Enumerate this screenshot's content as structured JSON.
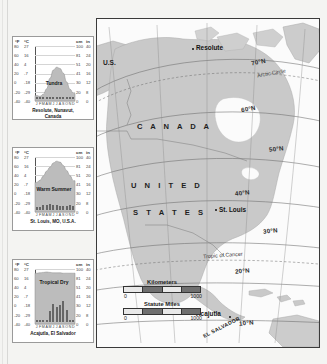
{
  "map": {
    "title": "North America climate regions map",
    "countries": [
      {
        "name": "CANADA",
        "label": "C A N A D A"
      },
      {
        "name": "UNITED",
        "label": "U N I T E D"
      },
      {
        "name": "STATES",
        "label": "S T A T E S"
      }
    ],
    "us_alaska_label": "U.S.",
    "el_salvador_label": "EL SALVADOR",
    "cities": [
      {
        "name": "Resolute",
        "label": "Resolute"
      },
      {
        "name": "St. Louis",
        "label": "St. Louis"
      },
      {
        "name": "Acajutla",
        "label": "Acajutla"
      }
    ],
    "latitudes": [
      {
        "label": "70°N"
      },
      {
        "label": "60°N"
      },
      {
        "label": "50°N"
      },
      {
        "label": "40°N"
      },
      {
        "label": "30°N"
      },
      {
        "label": "20°N"
      },
      {
        "label": "10°N"
      }
    ],
    "special_lines": [
      {
        "label": "Arctic Circle"
      },
      {
        "label": "Tropic of Cancer"
      }
    ],
    "scale": {
      "kilometers_title": "Kilometers",
      "kilometers_min": "0",
      "kilometers_max": "1000",
      "miles_title": "Statute Miles",
      "miles_min": "0",
      "miles_max": "1000"
    },
    "colors": {
      "land": "#c9c9c9",
      "ocean": "#fbfbfb",
      "frame": "#3a3a3a",
      "graticule": "#6b6b6b"
    }
  },
  "chart_data": [
    {
      "type": "bar",
      "id": "resolute",
      "title": "Tundra",
      "caption_line1": "Resolute, Nunavut,",
      "caption_line2": "Canada",
      "xlabel": "",
      "ylabel_left_f": "°F",
      "ylabel_left_c": "°C",
      "ylabel_right_cm": "cm",
      "ylabel_right_in": "in",
      "categories": [
        "J",
        "F",
        "M",
        "A",
        "M",
        "J",
        "J",
        "A",
        "S",
        "O",
        "N",
        "D"
      ],
      "yticks_f": [
        "80",
        "60",
        "40",
        "20",
        "0",
        "-20",
        "-40"
      ],
      "yticks_c": [
        "27",
        "16",
        "4",
        "-7",
        "-18",
        "-29",
        "-40"
      ],
      "yticks_cm": [
        "100",
        "81",
        "51",
        "41",
        "30",
        "20",
        "0"
      ],
      "yticks_in": [
        "40",
        "24",
        "20",
        "16",
        "12",
        "8",
        "0"
      ],
      "temp_f": [
        -27,
        -29,
        -24,
        -11,
        14,
        33,
        40,
        37,
        26,
        5,
        -12,
        -22
      ],
      "precip_cm": [
        0.4,
        0.3,
        0.5,
        0.8,
        0.9,
        1.3,
        2.3,
        3.6,
        2.5,
        1.3,
        0.6,
        0.4
      ],
      "ylim_f": [
        -40,
        90
      ],
      "ylim_cm": [
        0,
        100
      ],
      "grid": true
    },
    {
      "type": "bar",
      "id": "st-louis",
      "title": "Warm Summer",
      "caption_line1": "St. Louis,  MO, U.S.A.",
      "caption_line2": "",
      "xlabel": "",
      "ylabel_left_f": "°F",
      "ylabel_left_c": "°C",
      "ylabel_right_cm": "cm",
      "ylabel_right_in": "in",
      "categories": [
        "J",
        "F",
        "M",
        "A",
        "M",
        "J",
        "J",
        "A",
        "S",
        "O",
        "N",
        "D"
      ],
      "yticks_f": [
        "80",
        "60",
        "40",
        "20",
        "0",
        "-20",
        "-40"
      ],
      "yticks_c": [
        "27",
        "16",
        "4",
        "-7",
        "-18",
        "-29",
        "-40"
      ],
      "yticks_cm": [
        "100",
        "81",
        "51",
        "41",
        "30",
        "20",
        "0"
      ],
      "yticks_in": [
        "40",
        "24",
        "20",
        "16",
        "12",
        "8",
        "0"
      ],
      "temp_f": [
        30,
        35,
        45,
        57,
        66,
        76,
        80,
        78,
        70,
        58,
        46,
        34
      ],
      "precip_cm": [
        4.8,
        5.3,
        9.1,
        9.7,
        10.9,
        9.4,
        9.1,
        7.4,
        8.1,
        7.6,
        9.1,
        6.6
      ],
      "ylim_f": [
        -40,
        90
      ],
      "ylim_cm": [
        0,
        100
      ],
      "grid": true
    },
    {
      "type": "bar",
      "id": "acajutla",
      "title": "Tropical Dry",
      "caption_line1": "Acajutla, El Salvador",
      "caption_line2": "",
      "xlabel": "",
      "ylabel_left_f": "°F",
      "ylabel_left_c": "°C",
      "ylabel_right_cm": "cm",
      "ylabel_right_in": "in",
      "categories": [
        "J",
        "F",
        "M",
        "A",
        "M",
        "J",
        "J",
        "A",
        "S",
        "O",
        "N",
        "D"
      ],
      "yticks_f": [
        "80",
        "60",
        "40",
        "20",
        "0",
        "-20",
        "-40"
      ],
      "yticks_c": [
        "27",
        "16",
        "4",
        "-7",
        "-18",
        "-29",
        "-40"
      ],
      "yticks_cm": [
        "100",
        "81",
        "51",
        "41",
        "30",
        "20",
        "0"
      ],
      "yticks_in": [
        "40",
        "24",
        "20",
        "16",
        "12",
        "8",
        "0"
      ],
      "temp_f": [
        80,
        81,
        82,
        83,
        82,
        81,
        81,
        81,
        80,
        80,
        80,
        80
      ],
      "precip_cm": [
        0.2,
        0.1,
        0.5,
        4.0,
        19.5,
        32.0,
        28.0,
        31.5,
        38.0,
        22.5,
        4.5,
        0.6
      ],
      "ylim_f": [
        -40,
        90
      ],
      "ylim_cm": [
        0,
        100
      ],
      "grid": true
    }
  ]
}
